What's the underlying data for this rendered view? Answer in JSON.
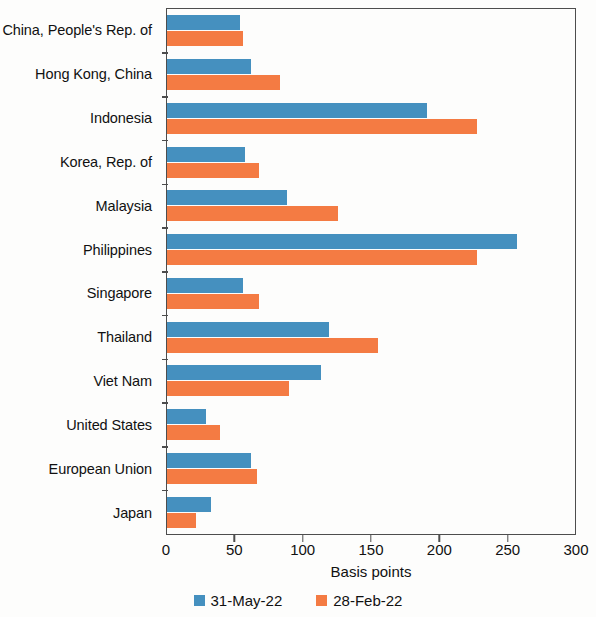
{
  "chart_data": {
    "type": "bar",
    "orientation": "horizontal",
    "title": "",
    "xlabel": "Basis points",
    "ylabel": "",
    "xlim": [
      0,
      300
    ],
    "xticks": [
      0,
      50,
      100,
      150,
      200,
      250,
      300
    ],
    "xtick_labels": [
      "0",
      "50",
      "100",
      "150",
      "200",
      "250",
      "300"
    ],
    "grid": false,
    "legend_position": "bottom",
    "categories": [
      "China, People's Rep. of",
      "Hong Kong, China",
      "Indonesia",
      "Korea, Rep. of",
      "Malaysia",
      "Philippines",
      "Singapore",
      "Thailand",
      "Viet Nam",
      "United States",
      "European Union",
      "Japan"
    ],
    "series": [
      {
        "name": "31-May-22",
        "color": "#4590bf",
        "values": [
          54,
          62,
          191,
          57,
          88,
          257,
          56,
          119,
          113,
          29,
          62,
          32
        ]
      },
      {
        "name": "28-Feb-22",
        "color": "#f47b43",
        "values": [
          56,
          83,
          228,
          68,
          126,
          228,
          68,
          155,
          90,
          39,
          66,
          21
        ]
      }
    ]
  },
  "legend": {
    "items": [
      {
        "label": "31-May-22",
        "swatch": "blue"
      },
      {
        "label": "28-Feb-22",
        "swatch": "orange"
      }
    ]
  }
}
